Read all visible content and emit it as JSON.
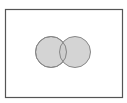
{
  "diagram": {
    "type": "venn",
    "sets": 2,
    "universe": {
      "x": 5,
      "y": 9,
      "width": 118,
      "height": 89,
      "stroke": "#555555",
      "fill": "#ffffff"
    },
    "circles": [
      {
        "name": "set-a",
        "cx": 51,
        "cy": 52,
        "r": 15.5,
        "fill": "#cccccc",
        "stroke": "#888888"
      },
      {
        "name": "set-b",
        "cx": 75,
        "cy": 52,
        "r": 15.5,
        "fill": "#cccccc",
        "stroke": "#888888"
      }
    ],
    "labels": []
  }
}
